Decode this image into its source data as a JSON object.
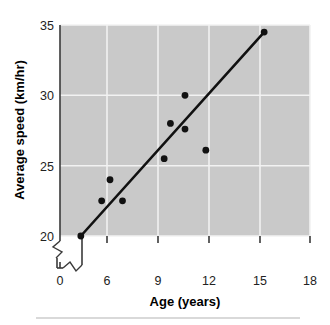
{
  "chart_data": {
    "type": "scatter",
    "title": "",
    "xlabel": "Age (years)",
    "ylabel": "Average speed (km/hr)",
    "xlim": [
      6,
      18
    ],
    "ylim": [
      20,
      35
    ],
    "x_ticks": [
      0,
      6,
      9,
      12,
      15,
      18
    ],
    "y_ticks": [
      20,
      25,
      30,
      35
    ],
    "x_axis_break": true,
    "y_axis_break": true,
    "grid": true,
    "legend": "none",
    "x": [
      7,
      8,
      8.4,
      9,
      11,
      11.3,
      12,
      12,
      13,
      15.8
    ],
    "y": [
      20,
      22.5,
      24,
      22.5,
      25.5,
      28,
      30,
      27.6,
      26.1,
      34.5
    ],
    "points": [
      {
        "x": 7,
        "y": 20
      },
      {
        "x": 8,
        "y": 22.5
      },
      {
        "x": 8.4,
        "y": 24
      },
      {
        "x": 9,
        "y": 22.5
      },
      {
        "x": 11,
        "y": 25.5
      },
      {
        "x": 11.3,
        "y": 28
      },
      {
        "x": 12,
        "y": 30
      },
      {
        "x": 12,
        "y": 27.6
      },
      {
        "x": 13,
        "y": 26.1
      },
      {
        "x": 15.8,
        "y": 34.5
      }
    ],
    "trend_line": {
      "label": "line of best fit",
      "x_start": 7,
      "y_start": 20,
      "x_end": 15.8,
      "y_end": 34.5
    },
    "colors": {
      "plot_background": "#c9c9c9",
      "gridline": "#f2f2f2",
      "point": "#111111",
      "trend_line": "#111111",
      "axis": "#3a3a3a",
      "text": "#000000",
      "page_background": "#ffffff",
      "bottom_rule": "#b3b3b3"
    }
  },
  "axis": {
    "x_title": "Age (years)",
    "y_title": "Average speed (km/hr)",
    "x_tick_labels": [
      "0",
      "6",
      "9",
      "12",
      "15",
      "18"
    ],
    "y_tick_labels": [
      "20",
      "25",
      "30",
      "35"
    ]
  }
}
